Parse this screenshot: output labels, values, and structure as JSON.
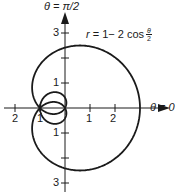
{
  "diagram": {
    "type": "polar-curve",
    "equation": {
      "lhs": "r",
      "rhs_prefix": "= 1− 2 cos",
      "frac_num": "θ",
      "frac_den": "2"
    },
    "axes": {
      "vertical_label": "θ = π/2",
      "horizontal_label": "θ = 0",
      "x_tick_labels_left": [
        "2",
        "1"
      ],
      "x_tick_labels_right": [
        "1",
        "2"
      ],
      "y_tick_labels_top": [
        "1",
        "3"
      ],
      "y_tick_labels_bottom": [
        "1",
        "3"
      ],
      "x_ticks": [
        -2,
        -1,
        1,
        2
      ],
      "y_ticks": [
        -3,
        -2,
        -1,
        1,
        2,
        3
      ]
    },
    "geometry": {
      "origin_x": 65,
      "origin_y": 108,
      "scale": 25,
      "theta_max_multiple_of_pi": 4
    },
    "colors": {
      "ink": "#1a1a1a",
      "background": "#ffffff"
    }
  }
}
